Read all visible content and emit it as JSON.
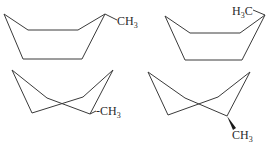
{
  "figure": {
    "structures": [
      {
        "id": "chair-equatorial",
        "label_main": "CH",
        "label_sub": "3",
        "label_prefix": ""
      },
      {
        "id": "chair-axial-left",
        "label_main": "C",
        "label_prefix": "H",
        "label_sub": "3"
      },
      {
        "id": "boat-left",
        "label_main": "-CH",
        "label_sub": "3",
        "label_prefix": ""
      },
      {
        "id": "boat-right",
        "label_main": "CH",
        "label_sub": "3",
        "label_prefix": ""
      }
    ],
    "line_color": "#3a3a3a",
    "text_color": "#2a2a2a"
  }
}
